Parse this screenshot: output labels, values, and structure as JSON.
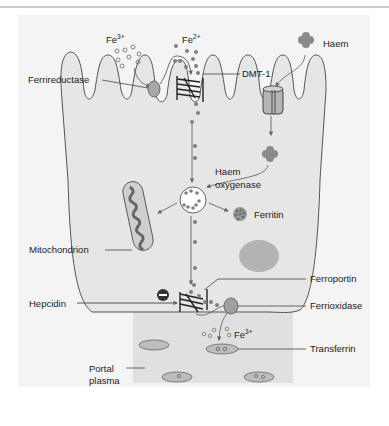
{
  "figure": {
    "colors": {
      "background": "#ffffff",
      "panel": "#f3f3f3",
      "cell": "#e4e4e4",
      "plasma": "#dcdcdc",
      "outline": "#555555",
      "dot": "#808080",
      "protein": "#9a9a9a",
      "nucleus": "#b3b3b3",
      "text": "#222222"
    },
    "labels": {
      "fe3_top": "Fe",
      "fe3_top_sup": "3+",
      "fe2_top": "Fe",
      "fe2_top_sup": "2+",
      "ferrireductase": "Ferrireductase",
      "dmt1": "DMT-1",
      "haem": "Haem",
      "haem_oxygenase_line1": "Haem",
      "haem_oxygenase_line2": "oxygenase",
      "ferritin": "Ferritin",
      "mitochondrion": "Mitochondrion",
      "ferroportin": "Ferroportin",
      "hepcidin": "Hepcidin",
      "ferrioxidase": "Ferrioxidase",
      "fe3_bottom": "Fe",
      "fe3_bottom_sup": "3+",
      "transferrin": "Transferrin",
      "portal_line1": "Portal",
      "portal_line2": "plasma"
    },
    "symbols": {
      "hepcidin_inhibition": "−"
    }
  }
}
